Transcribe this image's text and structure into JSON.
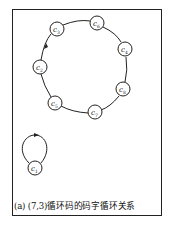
{
  "figure": {
    "caption": "(a) (7,3)循环码的码字循环关系",
    "cycles": [
      {
        "name": "cycle-length-7",
        "direction": "clockwise",
        "nodes": [
          {
            "label": "c",
            "sub": "3",
            "x": 57,
            "y": 29
          },
          {
            "label": "c",
            "sub": "6",
            "x": 97,
            "y": 23
          },
          {
            "label": "c",
            "sub": "4",
            "x": 125,
            "y": 49
          },
          {
            "label": "c",
            "sub": "8",
            "x": 123,
            "y": 89
          },
          {
            "label": "c",
            "sub": "7",
            "x": 95,
            "y": 112
          },
          {
            "label": "c",
            "sub": "5",
            "x": 55,
            "y": 103
          },
          {
            "label": "c",
            "sub": "2",
            "x": 40,
            "y": 67
          }
        ]
      },
      {
        "name": "self-loop",
        "nodes": [
          {
            "label": "c",
            "sub": "1",
            "x": 35,
            "y": 168
          }
        ]
      }
    ]
  }
}
